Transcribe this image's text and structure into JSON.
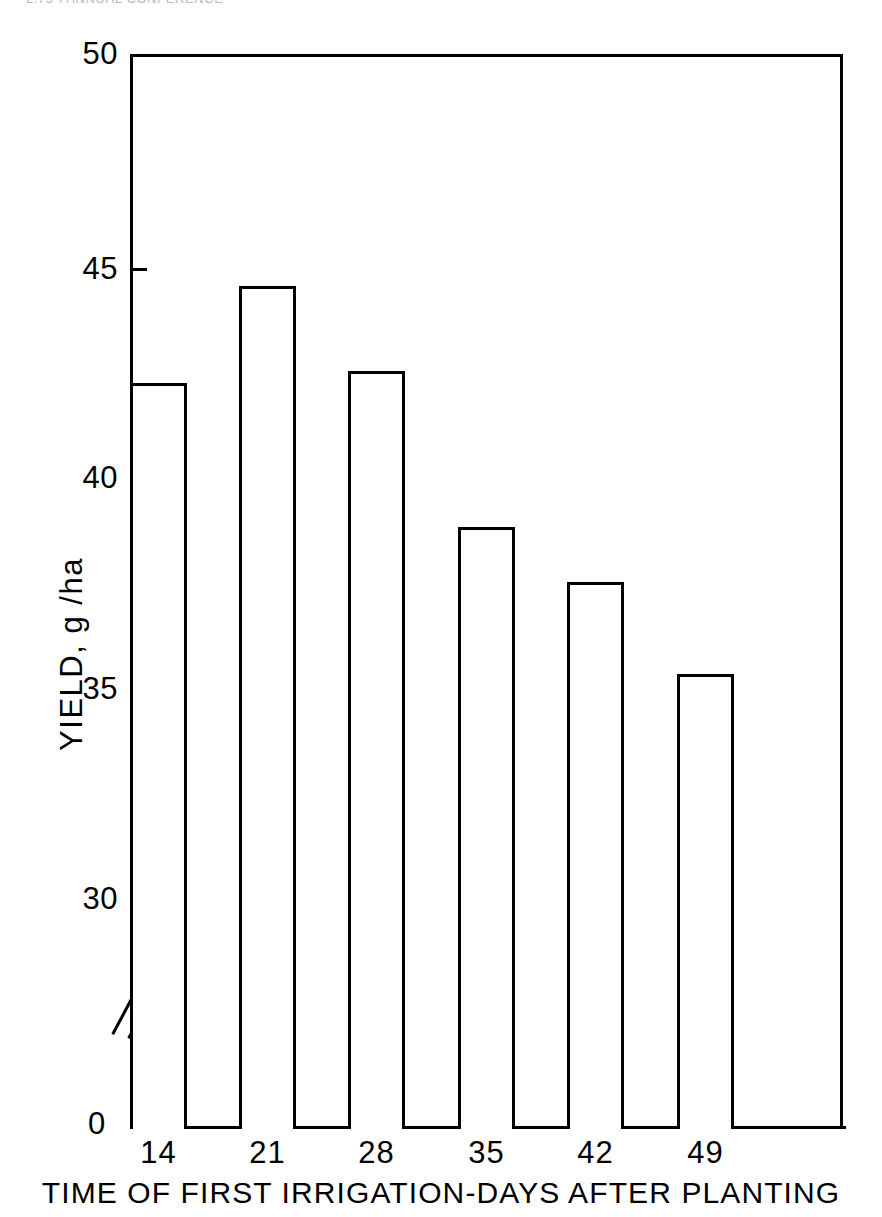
{
  "page": {
    "running_header": "2,75  )        ANNUAL  CONFERENCE"
  },
  "chart_data": {
    "type": "bar",
    "title": "",
    "subtitle": "",
    "xlabel": "TIME OF FIRST  IRRIGATION-DAYS AFTER PLANTING",
    "ylabel": "YIELD,  g /ha",
    "categories": [
      "14",
      "21",
      "28",
      "35",
      "42",
      "49"
    ],
    "values": [
      42.2,
      44.5,
      42.5,
      38.8,
      37.5,
      35.3
    ],
    "ylim": [
      0,
      50
    ],
    "y_axis_broken": true,
    "y_break_between": [
      0,
      30
    ],
    "yticks": [
      0,
      30,
      35,
      40,
      45,
      50
    ],
    "ytick_labels": [
      "0",
      "30",
      "35",
      "40",
      "45",
      "50"
    ],
    "grid": false,
    "legend": null,
    "bar_style": "open-outline",
    "bar_fill": "#ffffff",
    "bar_edge": "#000000",
    "axis_color": "#000000",
    "background": "#ffffff"
  },
  "axes": {
    "y_ticks": [
      {
        "label": "50",
        "value": 50
      },
      {
        "label": "45",
        "value": 45
      },
      {
        "label": "40",
        "value": 40
      },
      {
        "label": "35",
        "value": 35
      },
      {
        "label": "30",
        "value": 30
      },
      {
        "label": "0",
        "value": 0
      }
    ],
    "x_ticks": [
      {
        "label": "14"
      },
      {
        "label": "21"
      },
      {
        "label": "28"
      },
      {
        "label": "35"
      },
      {
        "label": "42"
      },
      {
        "label": "49"
      }
    ]
  }
}
